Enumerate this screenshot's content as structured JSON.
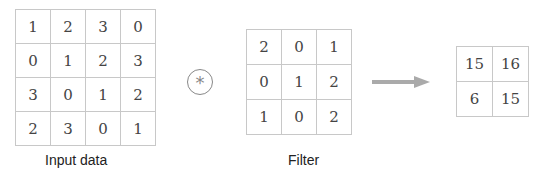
{
  "input": {
    "label": "Input data",
    "rows": [
      [
        1,
        2,
        3,
        0
      ],
      [
        0,
        1,
        2,
        3
      ],
      [
        3,
        0,
        1,
        2
      ],
      [
        2,
        3,
        0,
        1
      ]
    ]
  },
  "operator": {
    "symbol": "*",
    "icon": "convolution-operator-icon"
  },
  "filter": {
    "label": "Filter",
    "rows": [
      [
        2,
        0,
        1
      ],
      [
        0,
        1,
        2
      ],
      [
        1,
        0,
        2
      ]
    ]
  },
  "arrow": {
    "icon": "arrow-right-icon",
    "color": "#aaaaaa"
  },
  "output": {
    "rows": [
      [
        15,
        16
      ],
      [
        6,
        15
      ]
    ]
  }
}
